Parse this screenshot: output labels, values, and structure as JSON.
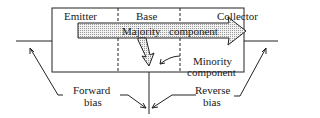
{
  "diagram": {
    "regions": {
      "emitter": "Emitter",
      "base": "Base",
      "collector": "Collector"
    },
    "arrow_label_left": "Majority",
    "arrow_label_right": "component",
    "minority_line1": "Minority",
    "minority_line2": "component",
    "forward_line1": "Forward",
    "forward_line2": "bias",
    "reverse_line1": "Reverse",
    "reverse_line2": "bias"
  }
}
